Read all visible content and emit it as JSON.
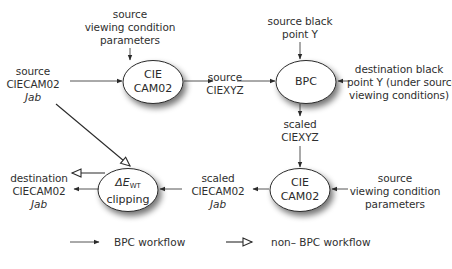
{
  "diagram": {
    "nodes": [
      {
        "id": "cam02-forward",
        "lines": [
          "CIE",
          "CAM02"
        ]
      },
      {
        "id": "bpc",
        "lines": [
          "BPC"
        ]
      },
      {
        "id": "cam02-inverse",
        "lines": [
          "CIE",
          "CAM02"
        ]
      },
      {
        "id": "delta-e-clipping",
        "symbol": "ΔE",
        "subscript": "WT",
        "line2": "clipping"
      }
    ],
    "labels": {
      "source_vc_top": [
        "source",
        "viewing condition",
        "parameters"
      ],
      "source_jab": [
        "source",
        "CIECAM02",
        "Jab"
      ],
      "source_ciexyz": [
        "source",
        "CIEXYZ"
      ],
      "source_black_point": [
        "source black",
        "point Y"
      ],
      "dest_black_point": [
        "destination black",
        "point Y (under source",
        "viewing conditions)"
      ],
      "scaled_ciexyz": [
        "scaled",
        "CIEXYZ"
      ],
      "source_vc_bottom": [
        "source",
        "viewing condition",
        "parameters"
      ],
      "scaled_jab": [
        "scaled",
        "CIECAM02",
        "Jab"
      ],
      "dest_jab": [
        "destination",
        "CIECAM02",
        "Jab"
      ]
    },
    "legend": {
      "bpc_workflow": "BPC workflow",
      "non_bpc_workflow": "non– BPC workflow"
    },
    "colors": {
      "line": "#2a2a2a",
      "node_fill": "#ffffff",
      "shadow": "#8c8c8c"
    }
  }
}
